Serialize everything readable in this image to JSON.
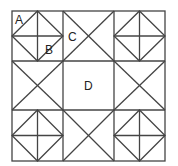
{
  "diagram": {
    "type": "quilt-block",
    "grid": "3x3",
    "labels": {
      "A": "A",
      "B": "B",
      "C": "C",
      "D": "D"
    },
    "line_color": "#444444",
    "background": "#ffffff"
  }
}
